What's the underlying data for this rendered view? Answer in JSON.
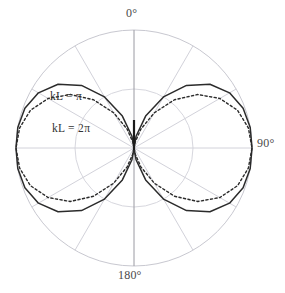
{
  "figure": {
    "title": "",
    "background_color": "#ffffff",
    "width": 285,
    "height": 293
  },
  "axis_labels": {
    "zero": "0°",
    "ninety": "90°",
    "one_eighty": "180°"
  },
  "annotations": {
    "curve_1": "kL = π",
    "curve_2": "kL = 2π"
  },
  "colors": {
    "grid": "#c8c8d0",
    "grid_inner": "#d5d5dc",
    "axis_vertical": "#9a9aa2",
    "curve_solid": "#2b2b2b",
    "curve_dotted": "#2b2b2b",
    "antenna_element": "#1a1a1a",
    "label_text": "#4a4a4a",
    "annotation_text": "#333333",
    "background": "#ffffff"
  },
  "chart_data": {
    "type": "line",
    "plot_style": "polar",
    "title": "",
    "xlabel": "",
    "ylabel": "",
    "angle_unit": "degrees",
    "angle_zero_location": "N",
    "angle_direction": "clockwise",
    "grid": true,
    "radial_range": [
      0,
      1
    ],
    "radial_gridline_fractions": [
      0.5,
      1.0
    ],
    "angular_gridline_degrees": [
      0,
      30,
      60,
      90,
      120,
      150,
      180,
      210,
      240,
      270,
      300,
      330
    ],
    "tick_labels": [
      "0°",
      "90°",
      "180°"
    ],
    "tick_label_angles_deg": [
      0,
      90,
      180
    ],
    "legend": "inline-annotation",
    "center": {
      "x": 134,
      "y": 148
    },
    "outer_radius_px": 118,
    "series": [
      {
        "name": "kL = π",
        "linestyle": "solid",
        "color": "#2b2b2b",
        "peak_radius_fraction": 1.0,
        "peak_angle_deg": 90,
        "null_angles_deg": [
          0,
          180
        ],
        "formula": "|cos((kL/2)cosθ) - cos(kL/2)| / sinθ, kL = π",
        "theta_deg": [
          0,
          10,
          20,
          30,
          40,
          50,
          60,
          70,
          80,
          90,
          100,
          110,
          120,
          130,
          140,
          150,
          160,
          170,
          180
        ],
        "r": [
          0.0,
          0.101,
          0.288,
          0.5,
          0.692,
          0.84,
          0.935,
          0.984,
          1.0,
          1.0,
          1.0,
          0.984,
          0.935,
          0.84,
          0.692,
          0.5,
          0.288,
          0.101,
          0.0
        ]
      },
      {
        "name": "kL = 2π",
        "linestyle": "dotted",
        "color": "#2b2b2b",
        "peak_radius_fraction": 1.0,
        "peak_angle_deg": 90,
        "null_angles_deg": [
          0,
          180
        ],
        "formula": "|cos((kL/2)cosθ) - cos(kL/2)| / sinθ, kL = 2π",
        "theta_deg": [
          0,
          10,
          20,
          30,
          40,
          50,
          60,
          70,
          80,
          90,
          100,
          110,
          120,
          130,
          140,
          150,
          160,
          170,
          180
        ],
        "r": [
          0.0,
          0.046,
          0.17,
          0.345,
          0.534,
          0.705,
          0.84,
          0.934,
          0.984,
          1.0,
          0.984,
          0.934,
          0.84,
          0.705,
          0.534,
          0.345,
          0.17,
          0.046,
          0.0
        ]
      }
    ],
    "antenna_element": {
      "description": "vertical dipole element drawn at center",
      "orientation": "vertical",
      "from": {
        "x": 134,
        "y": 120
      },
      "to": {
        "x": 134,
        "y": 150
      }
    }
  }
}
